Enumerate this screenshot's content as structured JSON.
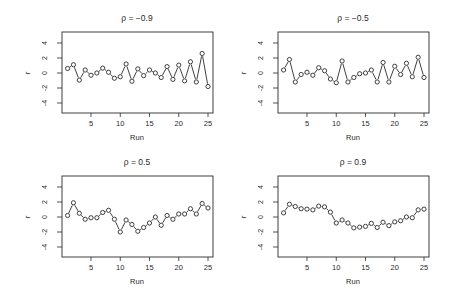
{
  "figure": {
    "ink_color": "#2a2a2a",
    "background": "#ffffff"
  },
  "chart_data": [
    {
      "type": "line",
      "title": "ρ = −0.9",
      "xlabel": "Run",
      "ylabel": "r",
      "xlim": [
        1,
        25
      ],
      "ylim": [
        -5,
        5
      ],
      "xticks": [
        5,
        10,
        15,
        20,
        25
      ],
      "yticks": [
        4,
        2,
        0,
        -2,
        -4
      ],
      "ytick_labels": [
        "4",
        "2",
        "0",
        "-2",
        "-4"
      ],
      "grid": false,
      "marker": "open-circle",
      "x": [
        1,
        2,
        3,
        4,
        5,
        6,
        7,
        8,
        9,
        10,
        11,
        12,
        13,
        14,
        15,
        16,
        17,
        18,
        19,
        20,
        21,
        22,
        23,
        24,
        25
      ],
      "values": [
        0.6,
        1.1,
        -0.95,
        0.4,
        -0.3,
        0.0,
        0.65,
        0.1,
        -0.7,
        -0.5,
        1.2,
        -1.1,
        0.55,
        -0.35,
        0.4,
        0.0,
        -0.6,
        0.85,
        -0.85,
        1.05,
        -1.05,
        1.5,
        -1.2,
        2.6,
        -1.8
      ]
    },
    {
      "type": "line",
      "title": "ρ = −0.5",
      "xlabel": "Run",
      "ylabel": "r",
      "xlim": [
        1,
        25
      ],
      "ylim": [
        -5,
        5
      ],
      "xticks": [
        5,
        10,
        15,
        20,
        25
      ],
      "yticks": [
        4,
        2,
        0,
        -2,
        -4
      ],
      "ytick_labels": [
        "4",
        "2",
        "0",
        "-2",
        "-4"
      ],
      "grid": false,
      "marker": "open-circle",
      "x": [
        1,
        2,
        3,
        4,
        5,
        6,
        7,
        8,
        9,
        10,
        11,
        12,
        13,
        14,
        15,
        16,
        17,
        18,
        19,
        20,
        21,
        22,
        23,
        24,
        25
      ],
      "values": [
        0.4,
        1.8,
        -1.2,
        -0.2,
        0.1,
        -0.3,
        0.7,
        0.3,
        -0.8,
        -1.3,
        1.6,
        -1.2,
        -0.6,
        -0.1,
        0.0,
        0.4,
        -1.2,
        1.4,
        -1.2,
        0.9,
        -0.2,
        1.3,
        -0.5,
        2.1,
        -0.6
      ]
    },
    {
      "type": "line",
      "title": "ρ = 0.5",
      "xlabel": "Run",
      "ylabel": "r",
      "xlim": [
        1,
        25
      ],
      "ylim": [
        -5,
        5
      ],
      "xticks": [
        5,
        10,
        15,
        20,
        25
      ],
      "yticks": [
        4,
        2,
        0,
        -2,
        -4
      ],
      "ytick_labels": [
        "4",
        "2",
        "0",
        "-2",
        "-4"
      ],
      "grid": false,
      "marker": "open-circle",
      "x": [
        1,
        2,
        3,
        4,
        5,
        6,
        7,
        8,
        9,
        10,
        11,
        12,
        13,
        14,
        15,
        16,
        17,
        18,
        19,
        20,
        21,
        22,
        23,
        24,
        25
      ],
      "values": [
        0.2,
        1.9,
        0.5,
        -0.3,
        -0.1,
        -0.1,
        0.6,
        0.9,
        -0.3,
        -2.0,
        -0.4,
        -1.0,
        -1.9,
        -1.4,
        -0.8,
        0.0,
        -1.1,
        0.2,
        -0.3,
        0.4,
        0.4,
        1.1,
        0.4,
        1.8,
        1.2
      ]
    },
    {
      "type": "line",
      "title": "ρ = 0.9",
      "xlabel": "Run",
      "ylabel": "r",
      "xlim": [
        1,
        25
      ],
      "ylim": [
        -5,
        5
      ],
      "xticks": [
        5,
        10,
        15,
        20,
        25
      ],
      "yticks": [
        4,
        2,
        0,
        -2,
        -4
      ],
      "ytick_labels": [
        "4",
        "2",
        "0",
        "-2",
        "-4"
      ],
      "grid": false,
      "marker": "open-circle",
      "x": [
        1,
        2,
        3,
        4,
        5,
        6,
        7,
        8,
        9,
        10,
        11,
        12,
        13,
        14,
        15,
        16,
        17,
        18,
        19,
        20,
        21,
        22,
        23,
        24,
        25
      ],
      "values": [
        0.55,
        1.7,
        1.4,
        1.1,
        1.05,
        0.95,
        1.45,
        1.35,
        0.65,
        -0.8,
        -0.4,
        -0.8,
        -1.45,
        -1.35,
        -1.25,
        -0.85,
        -1.4,
        -0.7,
        -1.15,
        -0.65,
        -0.5,
        0.0,
        -0.1,
        0.95,
        1.05
      ]
    }
  ]
}
